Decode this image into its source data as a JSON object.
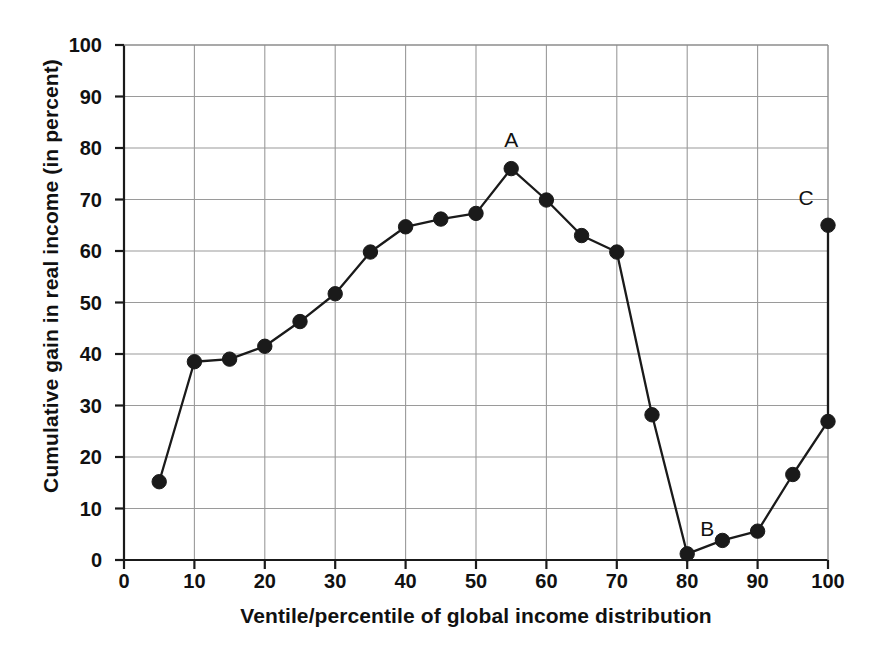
{
  "chart_data": {
    "type": "line",
    "title": "",
    "subtitle": "",
    "xlabel": "Ventile/percentile of global income distribution",
    "ylabel": "Cumulative gain in real income (in percent)",
    "xlim": [
      0,
      100
    ],
    "ylim": [
      0,
      100
    ],
    "xticks": [
      0,
      10,
      20,
      30,
      40,
      50,
      60,
      70,
      80,
      90,
      100
    ],
    "yticks": [
      0,
      10,
      20,
      30,
      40,
      50,
      60,
      70,
      80,
      90,
      100
    ],
    "grid": true,
    "legend": "none",
    "marker": "filled-circle",
    "line_color": "#1a1a1a",
    "marker_color": "#1a1a1a",
    "grid_color": "#9a9a9a",
    "axis_color": "#1a1a1a",
    "x": [
      5,
      10,
      15,
      20,
      25,
      30,
      35,
      40,
      45,
      50,
      55,
      60,
      65,
      70,
      75,
      80,
      85,
      90,
      95,
      100
    ],
    "values": [
      15.2,
      38.5,
      39.0,
      41.5,
      46.3,
      51.7,
      59.8,
      64.7,
      66.2,
      67.3,
      76.0,
      69.9,
      63.0,
      59.8,
      28.2,
      1.2,
      3.8,
      5.6,
      16.6,
      26.9
    ],
    "extra_points": [
      {
        "x": 100,
        "y": 65.0,
        "note": "top of vertical segment at the 100th percentile"
      }
    ],
    "annotations": [
      {
        "label": "A",
        "x": 55,
        "y": 76.0,
        "placement": "above"
      },
      {
        "label": "B",
        "x": 80,
        "y": 1.2,
        "placement": "above-right"
      },
      {
        "label": "C",
        "x": 100,
        "y": 65.0,
        "placement": "above-left"
      }
    ]
  },
  "axis_titles": {
    "x": "Ventile/percentile of global income distribution",
    "y": "Cumulative gain in real income (in percent)"
  }
}
